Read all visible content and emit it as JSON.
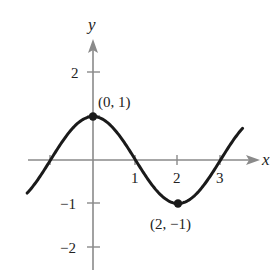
{
  "chart_data": {
    "type": "line",
    "title": "",
    "function": "y = cos(pi*x/2)",
    "xlabel": "x",
    "ylabel": "y",
    "xlim": [
      -1.6,
      3.8
    ],
    "ylim": [
      -2.6,
      2.9
    ],
    "grid": false,
    "legend": null,
    "x_ticks": [
      1,
      2,
      3
    ],
    "x_tick_labels": [
      "1",
      "2",
      "3"
    ],
    "y_ticks": [
      2,
      -1,
      -2
    ],
    "y_tick_labels": [
      "2",
      "−1",
      "−2"
    ],
    "series": [
      {
        "name": "curve",
        "x": [
          -1.5,
          -1,
          -0.5,
          0,
          0.5,
          1,
          1.5,
          2,
          2.5,
          3,
          3.5
        ],
        "y": [
          -0.707,
          0,
          0.707,
          1,
          0.707,
          0,
          -0.707,
          -1,
          -0.707,
          0,
          0.707
        ]
      }
    ],
    "annotations": [
      {
        "point": [
          0,
          1
        ],
        "label": "(0, 1)"
      },
      {
        "point": [
          2,
          -1
        ],
        "label": "(2, −1)"
      }
    ],
    "colors": {
      "axis": "#8a8a8a",
      "curve": "#1a1a1a",
      "text": "#222222"
    }
  }
}
